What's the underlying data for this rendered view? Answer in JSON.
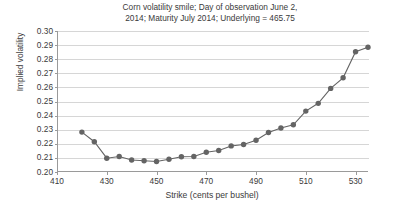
{
  "chart_data": {
    "type": "line",
    "title": "Corn volatility smile; Day of observation June 2,\n2014; Maturity July 2014; Underlying = 465.75",
    "xlabel": "Strike (cents per bushel)",
    "ylabel": "Implied volatility",
    "xlim": [
      410,
      535
    ],
    "ylim": [
      0.2,
      0.3
    ],
    "xticks": [
      410,
      430,
      450,
      470,
      490,
      510,
      530
    ],
    "xtick_labels": [
      "410",
      "430",
      "450",
      "470",
      "490",
      "510",
      "530"
    ],
    "yticks": [
      0.2,
      0.21,
      0.22,
      0.23,
      0.24,
      0.25,
      0.26,
      0.27,
      0.28,
      0.29,
      0.3
    ],
    "ytick_labels": [
      "0.20",
      "0.21",
      "0.22",
      "0.23",
      "0.24",
      "0.25",
      "0.26",
      "0.27",
      "0.28",
      "0.29",
      "0.30"
    ],
    "grid": "horizontal",
    "legend": "none",
    "marker": "circle",
    "series_color": "#646464",
    "x": [
      420,
      425,
      430,
      435,
      440,
      445,
      450,
      455,
      460,
      465,
      470,
      475,
      480,
      485,
      490,
      495,
      500,
      505,
      510,
      515,
      520,
      525,
      530,
      535
    ],
    "values": [
      0.2283,
      0.2215,
      0.2098,
      0.211,
      0.2085,
      0.208,
      0.2075,
      0.209,
      0.2108,
      0.211,
      0.214,
      0.2152,
      0.2185,
      0.2195,
      0.2225,
      0.228,
      0.2312,
      0.2335,
      0.2432,
      0.2487,
      0.2593,
      0.2668,
      0.2853,
      0.2885
    ],
    "series": [
      {
        "name": "Implied volatility",
        "values": [
          0.2283,
          0.2215,
          0.2098,
          0.211,
          0.2085,
          0.208,
          0.2075,
          0.209,
          0.2108,
          0.211,
          0.214,
          0.2152,
          0.2185,
          0.2195,
          0.2225,
          0.228,
          0.2312,
          0.2335,
          0.2432,
          0.2487,
          0.2593,
          0.2668,
          0.2853,
          0.2885
        ]
      }
    ]
  }
}
